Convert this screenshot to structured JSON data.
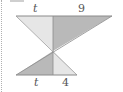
{
  "diagram": {
    "type": "similar-triangles",
    "labels": {
      "top_left": "t",
      "top_right": "9",
      "bottom_left": "t",
      "bottom_right": "4"
    },
    "colors": {
      "light_fill": "#e6e6e6",
      "dark_fill": "#b9b9b9",
      "stroke": "#8a8a8a"
    }
  }
}
